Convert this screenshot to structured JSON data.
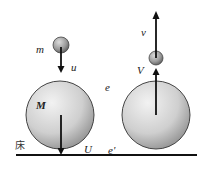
{
  "diagram": {
    "title": "",
    "labels": {
      "small_mass": "m",
      "small_velocity_before": "u",
      "large_mass": "M",
      "large_velocity_before": "U",
      "floor": "床",
      "restitution_balls": "e",
      "restitution_floor": "e'",
      "small_velocity_after": "v",
      "large_velocity_after": "V"
    },
    "colors": {
      "ball_fill_light": "#eeeeee",
      "ball_fill_dark": "#9a9a9a",
      "small_ball_light": "#d8d8d8",
      "small_ball_dark": "#666666",
      "outline": "#333333",
      "arrow": "#111111",
      "floor": "#111111"
    },
    "scenes": [
      {
        "name": "before",
        "description": "Small ball m falls with speed u onto large ball M falling with speed U toward floor"
      },
      {
        "name": "after",
        "description": "Large ball rebounds upward with speed V, small ball rebounds upward with speed v"
      }
    ]
  }
}
